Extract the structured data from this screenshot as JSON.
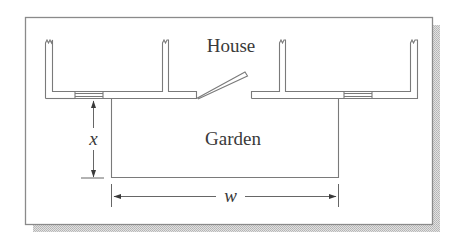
{
  "figure": {
    "type": "floor-plan-diagram",
    "labels": {
      "house": "House",
      "garden": "Garden",
      "depth_variable": "x",
      "width_variable": "w"
    },
    "colors": {
      "line": "#7a7a7a",
      "text": "#3a3a3a",
      "frame": "#8a8a8a",
      "shadow": "#c8c8c8",
      "background": "#ffffff"
    },
    "elements": {
      "frame": {
        "x": 25,
        "y": 17,
        "width": 407,
        "height": 207
      },
      "house_walls": [
        {
          "name": "left-wall-section",
          "x1": 45,
          "x2": 196
        },
        {
          "name": "right-wall-section",
          "x1": 251,
          "x2": 418
        }
      ],
      "windows": [
        {
          "name": "left-window",
          "x1": 75,
          "x2": 103
        },
        {
          "name": "right-window",
          "x1": 344,
          "x2": 372
        }
      ],
      "door": {
        "hinge_x": 197,
        "open_end_x": 247
      },
      "garden_rect": {
        "x1": 111,
        "x2": 338,
        "y1": 98,
        "y2": 177
      },
      "dimensions": [
        {
          "name": "x-dimension",
          "orientation": "vertical",
          "label": "x"
        },
        {
          "name": "w-dimension",
          "orientation": "horizontal",
          "label": "w"
        }
      ]
    }
  }
}
